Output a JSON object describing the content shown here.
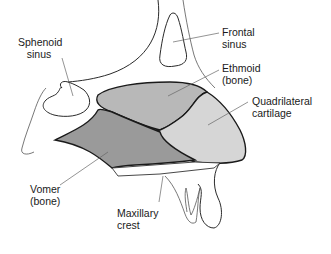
{
  "diagram": {
    "colors": {
      "ethmoid": "#b8b8b8",
      "quadrilateral": "#d6d6d6",
      "vomer": "#9a9a9a",
      "outline": "#1a1a1a",
      "background": "#ffffff"
    },
    "labels": {
      "sphenoid": "Sphenoid\n   sinus",
      "frontal": "Frontal\nsinus",
      "ethmoid": "Ethmoid\n(bone)",
      "quadrilateral": "Quadrilateral\ncartilage",
      "vomer": "Vomer\n(bone)",
      "maxillary": "Maxillary\ncrest"
    }
  }
}
